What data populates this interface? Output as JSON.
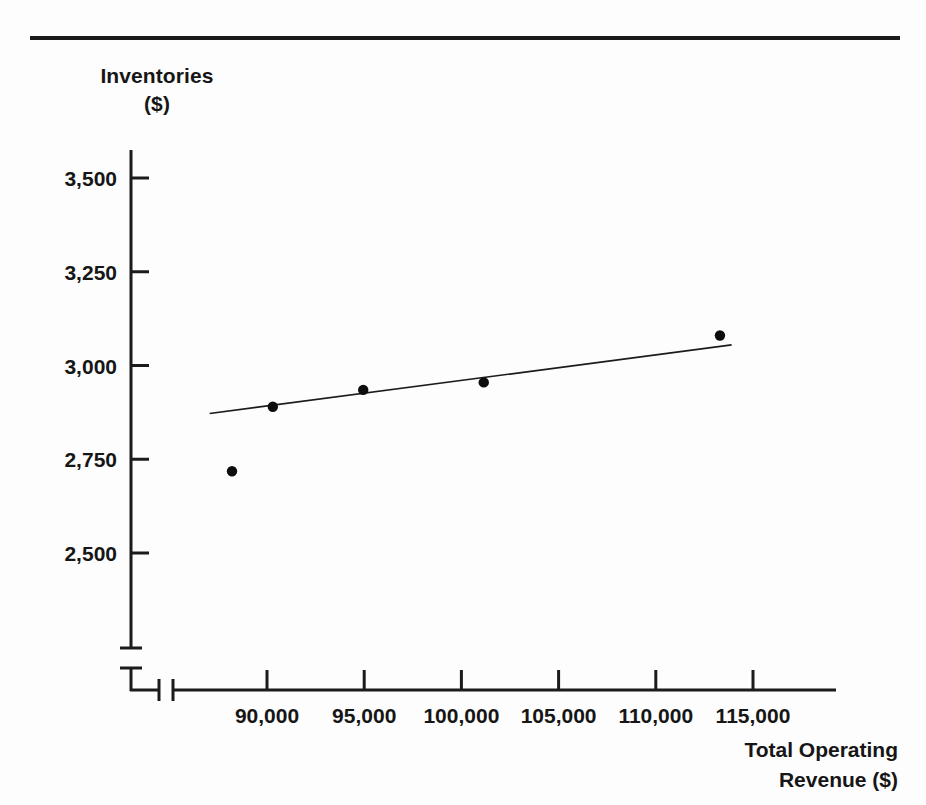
{
  "figure": {
    "y_axis_title_line1": "Inventories",
    "y_axis_title_line2": "($)",
    "x_axis_title_line1": "Total Operating",
    "x_axis_title_line2": "Revenue ($)"
  },
  "chart_data": {
    "type": "scatter",
    "title": "",
    "subtitle": "",
    "xlabel": "Total Operating Revenue ($)",
    "ylabel": "Inventories ($)",
    "grid": false,
    "legend": false,
    "legend_position": "none",
    "axis_break_x": true,
    "axis_break_y": true,
    "xlim": [
      86000,
      119000
    ],
    "ylim": [
      2400,
      3620
    ],
    "xticks": [
      90000,
      95000,
      100000,
      105000,
      110000,
      115000
    ],
    "xticklabels": [
      "90,000",
      "95,000",
      "100,000",
      "105,000",
      "110,000",
      "115,000"
    ],
    "yticks": [
      2500,
      2750,
      3000,
      3250,
      3500
    ],
    "yticklabels": [
      "2,500",
      "2,750",
      "3,000",
      "3,250",
      "3,500"
    ],
    "points": [
      {
        "x": 88200,
        "y": 2718
      },
      {
        "x": 90300,
        "y": 2890
      },
      {
        "x": 94950,
        "y": 2935
      },
      {
        "x": 101150,
        "y": 2955
      },
      {
        "x": 113300,
        "y": 3080
      }
    ],
    "series": [
      {
        "name": "Observations",
        "x": [
          88200,
          90300,
          94950,
          101150,
          113300
        ],
        "values": [
          2718,
          2890,
          2935,
          2955,
          3080
        ]
      },
      {
        "name": "Fitted trend line",
        "type": "line",
        "x": [
          87050,
          113900
        ],
        "values": [
          2872,
          3055
        ]
      }
    ],
    "trend_line": {
      "x_start": 87050,
      "y_start": 2872,
      "x_end": 113900,
      "y_end": 3055
    },
    "colors": {
      "ink": "#161616",
      "point": "#0d0d0d",
      "background": "#fdfdfd"
    }
  }
}
